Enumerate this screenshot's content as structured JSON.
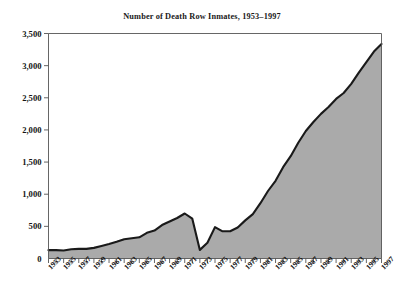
{
  "chart_data": {
    "type": "area",
    "title": "Number of Death Row Inmates, 1953–1997",
    "xlabel": "",
    "ylabel": "",
    "ylim": [
      0,
      3500
    ],
    "xlim": [
      1953,
      1997
    ],
    "grid": false,
    "legend": false,
    "series_name": "Death Row Inmates",
    "colors": {
      "fill": "#aaaaaa",
      "line": "#1a1a1a",
      "axis": "#555555",
      "background": "#ffffff",
      "text": "#141414"
    },
    "y_ticks": [
      0,
      500,
      1000,
      1500,
      2000,
      2500,
      3000,
      3500
    ],
    "y_tick_labels": [
      "0",
      "500",
      "1,000",
      "1,500",
      "2,000",
      "2,500",
      "3,000",
      "3,500"
    ],
    "x_tick_labels": [
      "1953",
      "1955",
      "1957",
      "1959",
      "1961",
      "1963",
      "1965",
      "1967",
      "1969",
      "1971",
      "1973",
      "1975",
      "1977",
      "1979",
      "1981",
      "1983",
      "1985",
      "1987",
      "1989",
      "1991",
      "1993",
      "1995",
      "1997"
    ],
    "x": [
      1953,
      1954,
      1955,
      1956,
      1957,
      1958,
      1959,
      1960,
      1961,
      1962,
      1963,
      1964,
      1965,
      1966,
      1967,
      1968,
      1969,
      1970,
      1971,
      1972,
      1973,
      1974,
      1975,
      1976,
      1977,
      1978,
      1979,
      1980,
      1981,
      1982,
      1983,
      1984,
      1985,
      1986,
      1987,
      1988,
      1989,
      1990,
      1991,
      1992,
      1993,
      1994,
      1995,
      1996,
      1997
    ],
    "values": [
      130,
      130,
      125,
      145,
      150,
      150,
      165,
      195,
      225,
      260,
      300,
      315,
      330,
      400,
      435,
      520,
      575,
      630,
      700,
      620,
      134,
      244,
      488,
      423,
      423,
      482,
      593,
      691,
      860,
      1050,
      1209,
      1420,
      1591,
      1800,
      1984,
      2124,
      2250,
      2356,
      2482,
      2575,
      2716,
      2890,
      3054,
      3219,
      3335
    ]
  }
}
